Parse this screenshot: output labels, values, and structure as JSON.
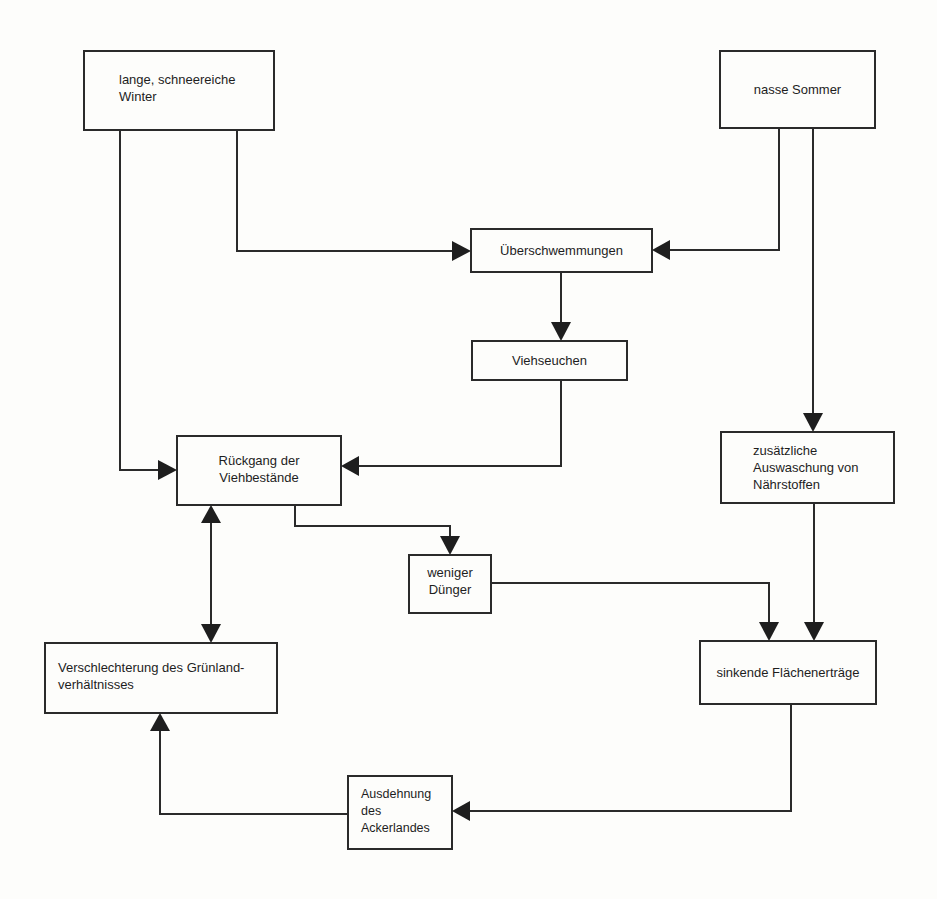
{
  "diagram": {
    "type": "flowchart",
    "language": "de",
    "nodes": [
      {
        "id": "winter",
        "label": "lange, schneereiche\nWinter"
      },
      {
        "id": "sommer",
        "label": "nasse Sommer"
      },
      {
        "id": "ueberschwemmungen",
        "label": "Überschwemmungen"
      },
      {
        "id": "viehseuchen",
        "label": "Viehseuchen"
      },
      {
        "id": "rueckgang",
        "label": "Rückgang der\nViehbestände"
      },
      {
        "id": "auswaschung",
        "label": "zusätzliche\nAuswaschung von\nNährstoffen"
      },
      {
        "id": "duenger",
        "label": "weniger\nDünger"
      },
      {
        "id": "gruenland",
        "label": "Verschlechterung des Grünland-\nverhältnisses"
      },
      {
        "id": "flaechenertraege",
        "label": "sinkende Flächenerträge"
      },
      {
        "id": "ackerland",
        "label": "Ausdehnung des\nAckerlandes"
      }
    ],
    "edges": [
      {
        "from": "winter",
        "to": "ueberschwemmungen"
      },
      {
        "from": "winter",
        "to": "rueckgang"
      },
      {
        "from": "sommer",
        "to": "ueberschwemmungen"
      },
      {
        "from": "sommer",
        "to": "auswaschung"
      },
      {
        "from": "ueberschwemmungen",
        "to": "viehseuchen"
      },
      {
        "from": "viehseuchen",
        "to": "rueckgang"
      },
      {
        "from": "rueckgang",
        "to": "duenger"
      },
      {
        "from": "rueckgang",
        "to": "gruenland",
        "bidirectional": true
      },
      {
        "from": "duenger",
        "to": "flaechenertraege"
      },
      {
        "from": "auswaschung",
        "to": "flaechenertraege"
      },
      {
        "from": "flaechenertraege",
        "to": "ackerland"
      },
      {
        "from": "ackerland",
        "to": "gruenland"
      }
    ],
    "colors": {
      "line": "#2a2a2a",
      "background": "#fdfdfb"
    }
  }
}
